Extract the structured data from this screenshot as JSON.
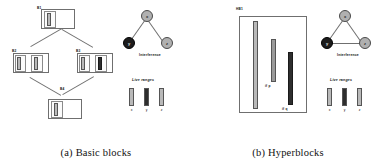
{
  "figure": {
    "panels": [
      {
        "id": "basic-blocks",
        "caption": "(a) Basic blocks",
        "cfg": {
          "blocks": [
            {
              "name": "B1",
              "label": "B1"
            },
            {
              "name": "B2",
              "label": "B2"
            },
            {
              "name": "B3",
              "label": "B3"
            },
            {
              "name": "B4",
              "label": "B4"
            }
          ]
        },
        "interference": {
          "title": "Interference",
          "nodes": [
            {
              "label": "x",
              "color": "#b0b0b0"
            },
            {
              "label": "y",
              "color": "#1c1c1c"
            },
            {
              "label": "z",
              "color": "#b0b0b0"
            }
          ],
          "edge_count": 2
        },
        "live_ranges": {
          "title": "Live ranges",
          "bars": [
            {
              "label": "x",
              "color": "#b9b9b9"
            },
            {
              "label": "y",
              "color": "#2e2e2e"
            },
            {
              "label": "z",
              "color": "#b9b9b9"
            }
          ]
        }
      },
      {
        "id": "hyperblocks",
        "caption": "(b) Hyperblocks",
        "hyperblock": {
          "label": "HB1",
          "bars": [
            {
              "name": "x",
              "annotation": "",
              "color": "#b9b9b9"
            },
            {
              "name": "y",
              "annotation": "if p",
              "color": "#9a9a9a"
            },
            {
              "name": "z",
              "annotation": "if q",
              "color": "#2e2e2e"
            }
          ]
        },
        "interference": {
          "title": "Interference",
          "nodes": [
            {
              "label": "x",
              "color": "#b0b0b0"
            },
            {
              "label": "y",
              "color": "#1c1c1c"
            },
            {
              "label": "z",
              "color": "#b0b0b0"
            }
          ],
          "edge_count": 3
        },
        "live_ranges": {
          "title": "Live ranges",
          "bars": [
            {
              "label": "x",
              "color": "#b9b9b9"
            },
            {
              "label": "y",
              "color": "#2e2e2e"
            },
            {
              "label": "z",
              "color": "#b9b9b9"
            }
          ]
        }
      }
    ]
  }
}
